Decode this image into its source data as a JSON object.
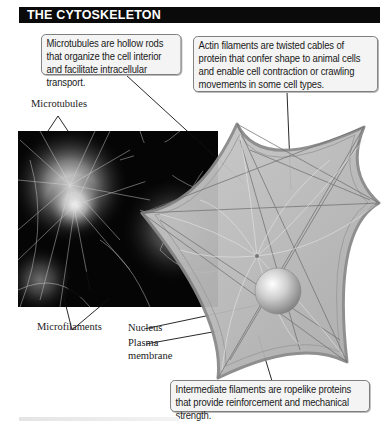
{
  "title": "THE CYTOSKELETON",
  "callouts": {
    "microtubules": "Microtubules are hollow rods that organize the cell interior and facilitate intracellular transport.",
    "actin": "Actin filaments are twisted cables of protein that confer shape to animal cells and enable cell contraction or crawling movements in some cell types.",
    "intermediate": "Intermediate filaments are ropelike proteins that provide reinforcement and mechanical strength."
  },
  "labels": {
    "microtubules": "Microtubules",
    "microfilaments": "Microfilaments",
    "nucleus": "Nucleus",
    "plasma_line1": "Plasma",
    "plasma_line2": "membrane"
  },
  "colors": {
    "title_bg": "#0a0a0a",
    "title_fg": "#ffffff",
    "callout_bg": "#f4f4f4",
    "cell_fill": "#b9b9b9",
    "micrograph_bg": "#050505"
  }
}
